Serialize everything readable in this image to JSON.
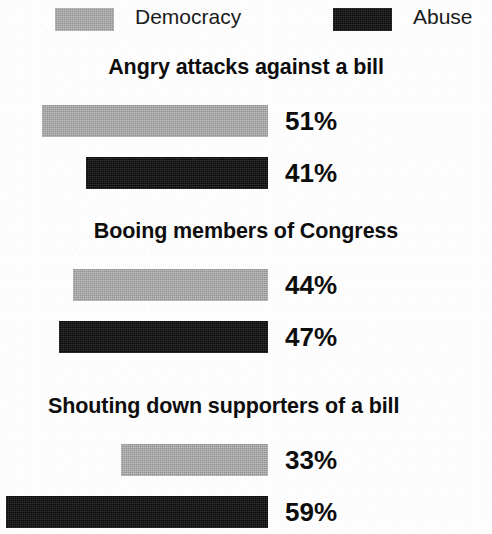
{
  "chart_data": {
    "type": "bar",
    "orientation": "horizontal",
    "title": "",
    "xlabel": "",
    "ylabel": "",
    "xlim": [
      0,
      100
    ],
    "grid": false,
    "legend_position": "top",
    "value_suffix": "%",
    "categories": [
      "Angry attacks against a bill",
      "Booing members of Congress",
      "Shouting down supporters of a bill"
    ],
    "series": [
      {
        "name": "Democracy",
        "color": "#a9a9a9",
        "values": [
          51,
          44,
          33
        ]
      },
      {
        "name": "Abuse",
        "color": "#131313",
        "values": [
          41,
          47,
          59
        ]
      }
    ]
  },
  "legend": {
    "items": [
      {
        "label": "Democracy",
        "swatch": "legend-swatch-gray"
      },
      {
        "label": "Abuse",
        "swatch": "legend-swatch-black"
      }
    ]
  },
  "groups": [
    {
      "title": "Angry attacks against a bill",
      "bars": [
        {
          "series": "Democracy",
          "value": 51,
          "value_label": "51%"
        },
        {
          "series": "Abuse",
          "value": 41,
          "value_label": "41%"
        }
      ]
    },
    {
      "title": "Booing members of Congress",
      "bars": [
        {
          "series": "Democracy",
          "value": 44,
          "value_label": "44%"
        },
        {
          "series": "Abuse",
          "value": 47,
          "value_label": "47%"
        }
      ]
    },
    {
      "title": "Shouting down supporters of a bill",
      "bars": [
        {
          "series": "Democracy",
          "value": 33,
          "value_label": "33%"
        },
        {
          "series": "Abuse",
          "value": 59,
          "value_label": "59%"
        }
      ]
    }
  ]
}
